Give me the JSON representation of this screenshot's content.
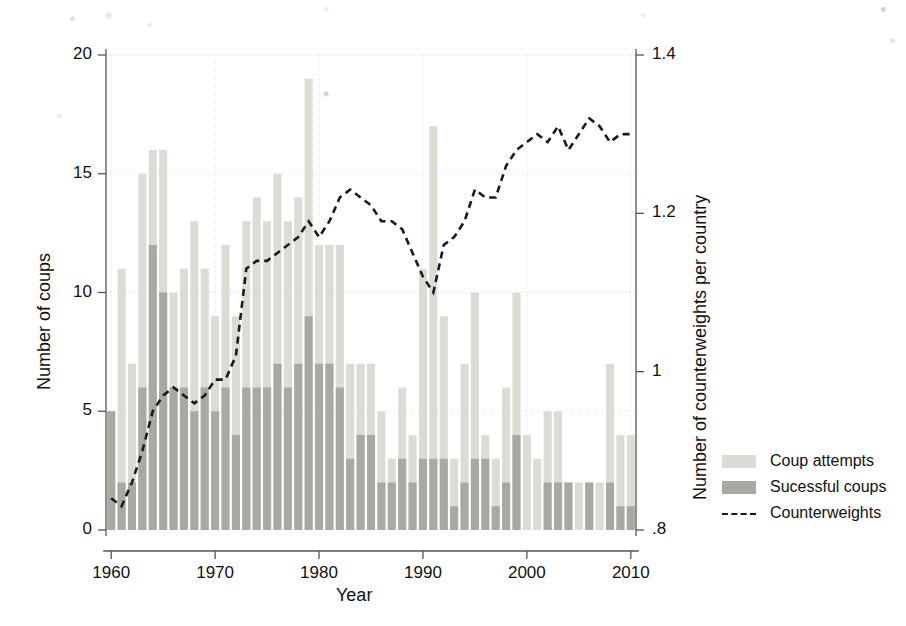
{
  "chart_data": {
    "type": "bar",
    "title": "",
    "xlabel": "Year",
    "ylabel": "Number of coups",
    "y2label": "Number of counterweights per country",
    "xlim": [
      1959.5,
      2010.5
    ],
    "ylim": [
      0,
      20
    ],
    "y2lim": [
      0.8,
      1.4
    ],
    "grid": true,
    "legend_position": "right",
    "x_ticks": [
      "1960",
      "1970",
      "1980",
      "1990",
      "2000",
      "2010"
    ],
    "x_tick_values": [
      1960,
      1970,
      1980,
      1990,
      2000,
      2010
    ],
    "y_ticks": [
      "0",
      "5",
      "10",
      "15",
      "20"
    ],
    "y_tick_values": [
      0,
      5,
      10,
      15,
      20
    ],
    "y2_ticks": [
      ".8",
      "1",
      "1.2",
      "1.4"
    ],
    "y2_tick_values": [
      0.8,
      1.0,
      1.2,
      1.4
    ],
    "years": [
      1960,
      1961,
      1962,
      1963,
      1964,
      1965,
      1966,
      1967,
      1968,
      1969,
      1970,
      1971,
      1972,
      1973,
      1974,
      1975,
      1976,
      1977,
      1978,
      1979,
      1980,
      1981,
      1982,
      1983,
      1984,
      1985,
      1986,
      1987,
      1988,
      1989,
      1990,
      1991,
      1992,
      1993,
      1994,
      1995,
      1996,
      1997,
      1998,
      1999,
      2000,
      2001,
      2002,
      2003,
      2004,
      2005,
      2006,
      2007,
      2008,
      2009,
      2010
    ],
    "series": [
      {
        "name": "Coup attempts",
        "color": "#dcdcd6",
        "values": [
          5,
          11,
          7,
          15,
          16,
          16,
          10,
          11,
          13,
          11,
          9,
          12,
          9,
          13,
          14,
          13,
          15,
          13,
          14,
          19,
          12,
          12,
          12,
          7,
          7,
          7,
          5,
          3,
          6,
          4,
          11,
          17,
          9,
          3,
          7,
          10,
          4,
          3,
          6,
          10,
          4,
          3,
          5,
          5,
          2,
          2,
          2,
          2,
          7,
          4,
          4
        ]
      },
      {
        "name": "Sucessful coups",
        "color": "#a9a9a2",
        "values": [
          5,
          2,
          2,
          6,
          12,
          10,
          6,
          6,
          5,
          6,
          5,
          6,
          4,
          6,
          6,
          6,
          7,
          6,
          7,
          9,
          7,
          7,
          6,
          3,
          4,
          4,
          2,
          2,
          3,
          2,
          3,
          3,
          3,
          1,
          2,
          3,
          3,
          1,
          2,
          4,
          0,
          0,
          2,
          2,
          2,
          0,
          2,
          0,
          2,
          1,
          1
        ]
      }
    ],
    "counterweights": {
      "name": "Counterweights",
      "color": "#1a1a1a",
      "style": "dashed",
      "values": [
        0.84,
        0.83,
        0.86,
        0.9,
        0.95,
        0.97,
        0.98,
        0.97,
        0.96,
        0.97,
        0.99,
        0.99,
        1.02,
        1.13,
        1.14,
        1.14,
        1.15,
        1.16,
        1.17,
        1.19,
        1.17,
        1.19,
        1.22,
        1.23,
        1.22,
        1.21,
        1.19,
        1.19,
        1.18,
        1.15,
        1.12,
        1.1,
        1.16,
        1.17,
        1.19,
        1.23,
        1.22,
        1.22,
        1.26,
        1.28,
        1.29,
        1.3,
        1.29,
        1.31,
        1.28,
        1.3,
        1.32,
        1.31,
        1.29,
        1.3,
        1.3
      ]
    },
    "legend": [
      {
        "label": "Coup attempts",
        "swatch": "light-gray-bar"
      },
      {
        "label": "Sucessful coups",
        "swatch": "dark-gray-bar"
      },
      {
        "label": "Counterweights",
        "swatch": "dashed-line"
      }
    ],
    "colors": {
      "coup_attempts": "#dcdcd6",
      "successful_coups": "#a9a9a2",
      "counterweights_line": "#1a1a1a",
      "axis": "#555555",
      "grid": "#dddddd",
      "background": "#ffffff"
    }
  }
}
